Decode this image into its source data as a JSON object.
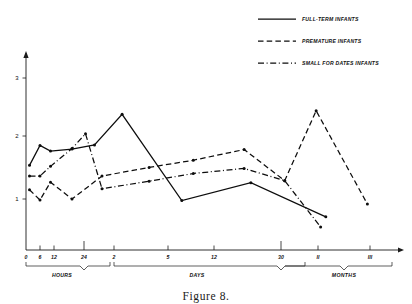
{
  "caption": "Figure 8.",
  "axes": {
    "y_ticks": [
      "1",
      "2",
      "3"
    ],
    "x_ticks": [
      "0",
      "6",
      "12",
      "24",
      "2",
      "5",
      "12",
      "30",
      "II",
      "III"
    ],
    "group_labels": [
      "HOURS",
      "DAYS",
      "MONTHS"
    ]
  },
  "legend": {
    "items": [
      {
        "label": "FULL-TERM INFANTS",
        "style": "solid"
      },
      {
        "label": "PREMATURE INFANTS",
        "style": "dashed"
      },
      {
        "label": "SMALL FOR DATES INFANTS",
        "style": "dashdot"
      }
    ]
  },
  "colors": {
    "ink": "#0d0d0d",
    "background": "#ffffff"
  },
  "chart_data": {
    "type": "line",
    "title": "Figure 8.",
    "xlabel": "",
    "ylabel": "",
    "ylim": [
      0,
      3.4
    ],
    "grid": false,
    "legend_position": "top-right",
    "x_tick_labels": [
      "0",
      "6",
      "12",
      "24",
      "2",
      "5",
      "12",
      "30",
      "II",
      "III"
    ],
    "x_tick_positions": [
      0,
      1,
      2,
      3,
      4,
      5,
      6,
      7,
      8,
      9
    ],
    "x_group_spans": [
      {
        "label": "HOURS",
        "from": 0,
        "to": 3
      },
      {
        "label": "DAYS",
        "from": 3,
        "to": 7
      },
      {
        "label": "MONTHS",
        "from": 7,
        "to": 9
      }
    ],
    "y_tick_values": [
      1,
      2,
      3
    ],
    "series": [
      {
        "name": "FULL-TERM INFANTS",
        "style": "solid",
        "points": [
          {
            "x": 0.25,
            "y": 1.66
          },
          {
            "x": 1.0,
            "y": 2.05
          },
          {
            "x": 1.75,
            "y": 1.94
          },
          {
            "x": 2.6,
            "y": 1.98
          },
          {
            "x": 3.35,
            "y": 2.06
          },
          {
            "x": 4.15,
            "y": 2.66
          },
          {
            "x": 5.3,
            "y": 0.97
          },
          {
            "x": 6.55,
            "y": 1.32
          },
          {
            "x": 8.15,
            "y": 0.65
          }
        ]
      },
      {
        "name": "PREMATURE INFANTS",
        "style": "dashed",
        "points": [
          {
            "x": 0.25,
            "y": 1.18
          },
          {
            "x": 1.0,
            "y": 0.98
          },
          {
            "x": 1.75,
            "y": 1.33
          },
          {
            "x": 2.6,
            "y": 1.0
          },
          {
            "x": 3.6,
            "y": 1.45
          },
          {
            "x": 4.65,
            "y": 1.62
          },
          {
            "x": 5.55,
            "y": 1.76
          },
          {
            "x": 6.45,
            "y": 1.97
          },
          {
            "x": 7.1,
            "y": 1.36
          },
          {
            "x": 7.95,
            "y": 2.73
          },
          {
            "x": 8.95,
            "y": 0.9
          }
        ]
      },
      {
        "name": "SMALL FOR DATES INFANTS",
        "style": "dashdot",
        "points": [
          {
            "x": 0.25,
            "y": 1.45
          },
          {
            "x": 1.0,
            "y": 1.45
          },
          {
            "x": 1.75,
            "y": 1.64
          },
          {
            "x": 2.6,
            "y": 1.99
          },
          {
            "x": 3.05,
            "y": 2.28
          },
          {
            "x": 3.6,
            "y": 1.2
          },
          {
            "x": 4.65,
            "y": 1.35
          },
          {
            "x": 5.55,
            "y": 1.5
          },
          {
            "x": 6.45,
            "y": 1.6
          },
          {
            "x": 7.1,
            "y": 1.36
          },
          {
            "x": 8.05,
            "y": 0.45
          }
        ]
      }
    ]
  }
}
